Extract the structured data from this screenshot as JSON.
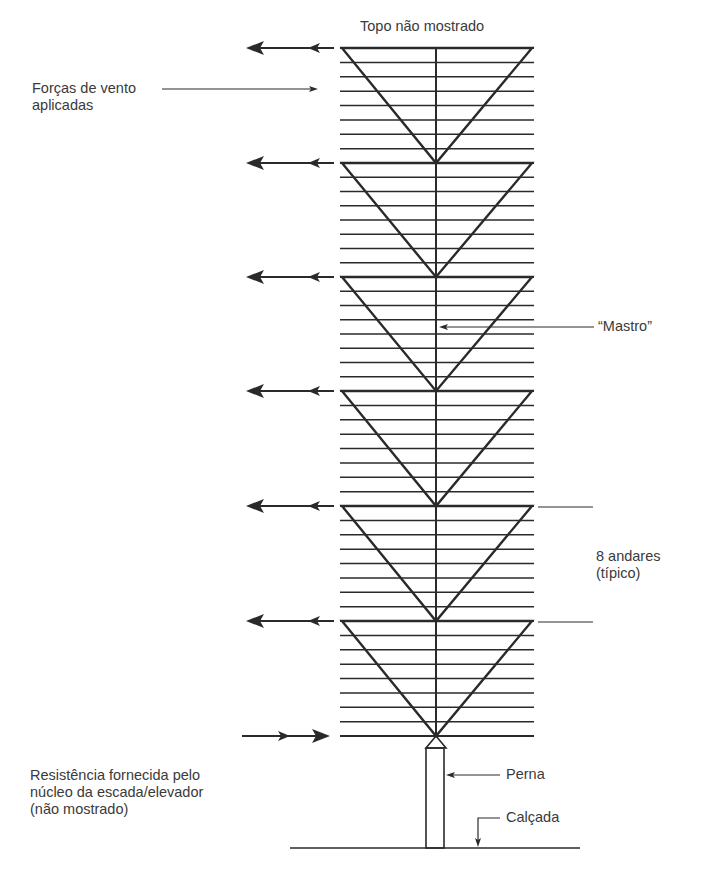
{
  "labels": {
    "top_not_shown": "Topo não mostrado",
    "wind_forces": "Forças de vento\naplicadas",
    "mast": "“Mastro”",
    "floors": "8 andares\n(típico)",
    "resistance": "Resistência fornecida pelo\nnúcleo da escada/elevador\n(não mostrado)",
    "leg": "Perna",
    "sidewalk": "Calçada"
  },
  "structure": {
    "modules": 6,
    "floors_per_module": 8,
    "module_tops_y": [
      48,
      163,
      277,
      391,
      506,
      621
    ],
    "base_y": 736,
    "tower_left_x": 342,
    "tower_right_x": 532,
    "center_x": 436,
    "ground_y": 848
  },
  "colors": {
    "line": "#2a2a2a",
    "text": "#3a3a3a",
    "background": "#ffffff"
  }
}
